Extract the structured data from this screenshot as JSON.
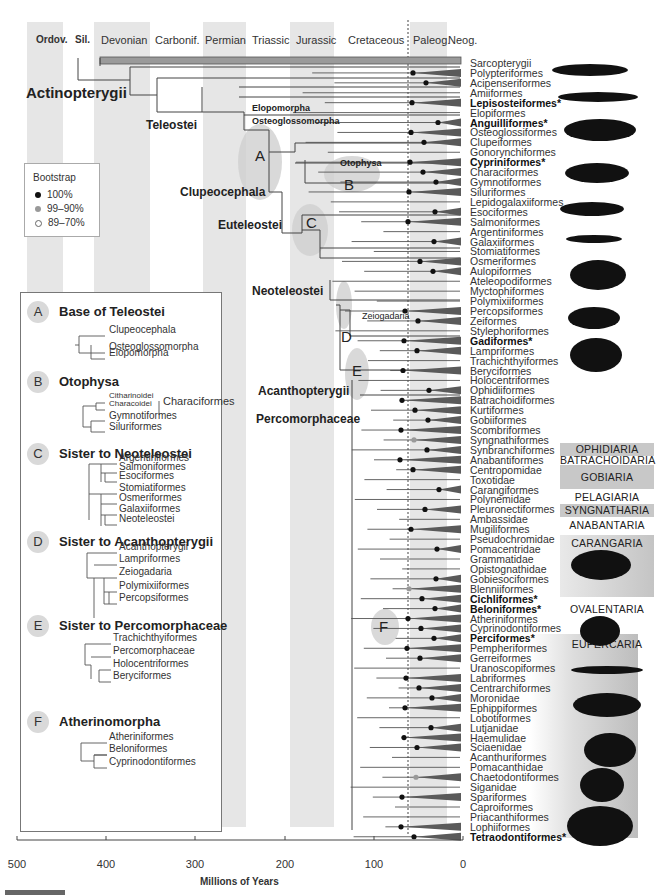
{
  "figure": {
    "axis_title": "Millions of Years",
    "axis_ticks": [
      "500",
      "400",
      "300",
      "200",
      "100",
      "0"
    ],
    "kpg_boundary_ma": 66
  },
  "periods": [
    {
      "label": "Ordov.",
      "bold": true
    },
    {
      "label": "Sil.",
      "bold": true
    },
    {
      "label": "Devonian"
    },
    {
      "label": "Carbonif."
    },
    {
      "label": "Permian"
    },
    {
      "label": "Triassic"
    },
    {
      "label": "Jurassic"
    },
    {
      "label": "Cretaceous"
    },
    {
      "label": "Paleog."
    },
    {
      "label": "Neog."
    }
  ],
  "bootstrap": {
    "title": "Bootstrap",
    "items": [
      {
        "label": "100%",
        "color": "#111111"
      },
      {
        "label": "99–90%",
        "color": "#999999"
      },
      {
        "label": "89–70%",
        "color": "#ffffff"
      }
    ]
  },
  "clades": {
    "actinopterygii": "Actinopterygii",
    "teleostei": "Teleostei",
    "elopomorpha": "Elopomorpha",
    "osteoglossomorpha": "Osteoglossomorpha",
    "clupeocephala": "Clupeocephala",
    "otophysa": "Otophysa",
    "euteleostei": "Euteleostei",
    "neoteleostei": "Neoteleostei",
    "zeiogadaria": "Zeiogadaria",
    "acanthopterygii": "Acanthopterygii",
    "percomorphaceae": "Percomorphaceae",
    "markers": [
      "A",
      "B",
      "C",
      "D",
      "E",
      "F"
    ]
  },
  "taxa": [
    {
      "name": "Sarcopterygii"
    },
    {
      "name": "Polypteriformes"
    },
    {
      "name": "Acipenseriformes"
    },
    {
      "name": "Amiiformes"
    },
    {
      "name": "Lepisosteiformes*",
      "bold": true
    },
    {
      "name": "Elopiformes"
    },
    {
      "name": "Anguilliformes*",
      "bold": true
    },
    {
      "name": "Osteoglossiformes"
    },
    {
      "name": "Clupeiformes"
    },
    {
      "name": "Gonorynchiformes"
    },
    {
      "name": "Cypriniformes*",
      "bold": true
    },
    {
      "name": "Characiformes"
    },
    {
      "name": "Gymnotiformes"
    },
    {
      "name": "Siluriformes"
    },
    {
      "name": "Lepidogalaxiiformes"
    },
    {
      "name": "Esociformes"
    },
    {
      "name": "Salmoniformes"
    },
    {
      "name": "Argentiniformes"
    },
    {
      "name": "Galaxiiformes"
    },
    {
      "name": "Stomiatiformes"
    },
    {
      "name": "Osmeriformes"
    },
    {
      "name": "Aulopiformes"
    },
    {
      "name": "Ateleopodiformes"
    },
    {
      "name": "Myctophiformes"
    },
    {
      "name": "Polymixiiformes"
    },
    {
      "name": "Percopsiformes"
    },
    {
      "name": "Zeiformes"
    },
    {
      "name": "Stylephoriformes"
    },
    {
      "name": "Gadiformes*",
      "bold": true
    },
    {
      "name": "Lampriformes"
    },
    {
      "name": "Trachichthyiformes"
    },
    {
      "name": "Beryciformes"
    },
    {
      "name": "Holocentriformes"
    },
    {
      "name": "Ophidiiformes"
    },
    {
      "name": "Batrachoidiformes"
    },
    {
      "name": "Kurtiformes"
    },
    {
      "name": "Gobiiformes"
    },
    {
      "name": "Scombriformes"
    },
    {
      "name": "Syngnathiformes"
    },
    {
      "name": "Synbranchiformes"
    },
    {
      "name": "Anabantiformes"
    },
    {
      "name": "Centropomidae"
    },
    {
      "name": "Toxotidae"
    },
    {
      "name": "Carangiformes"
    },
    {
      "name": "Polynemidae"
    },
    {
      "name": "Pleuronectiformes"
    },
    {
      "name": "Ambassidae"
    },
    {
      "name": "Mugiliformes"
    },
    {
      "name": "Pseudochromidae"
    },
    {
      "name": "Pomacentridae"
    },
    {
      "name": "Grammatidae"
    },
    {
      "name": "Opistognathidae"
    },
    {
      "name": "Gobiesociformes"
    },
    {
      "name": "Blenniiformes"
    },
    {
      "name": "Cichliformes*",
      "bold": true
    },
    {
      "name": "Beloniformes*",
      "bold": true
    },
    {
      "name": "Atheriniformes"
    },
    {
      "name": "Cyprinodontiformes"
    },
    {
      "name": "Perciformes*",
      "bold": true
    },
    {
      "name": "Pempheriformes"
    },
    {
      "name": "Gerreiformes"
    },
    {
      "name": "Uranoscopiformes"
    },
    {
      "name": "Labriformes"
    },
    {
      "name": "Centrarchiformes"
    },
    {
      "name": "Moronidae"
    },
    {
      "name": "Ephippiformes"
    },
    {
      "name": "Lobotiformes"
    },
    {
      "name": "Lutjanidae"
    },
    {
      "name": "Haemulidae"
    },
    {
      "name": "Sciaenidae"
    },
    {
      "name": "Acanthuriformes"
    },
    {
      "name": "Pomacanthidae"
    },
    {
      "name": "Chaetodontiformes"
    },
    {
      "name": "Siganidae"
    },
    {
      "name": "Spariformes"
    },
    {
      "name": "Caproiformes"
    },
    {
      "name": "Priacanthiformes"
    },
    {
      "name": "Lophiiformes"
    },
    {
      "name": "Tetraodontiformes*",
      "bold": true
    }
  ],
  "series_tags": [
    {
      "label": "OPHIDIARIA",
      "shaded": true
    },
    {
      "label": "BATRACHOIDARIA",
      "shaded": false
    },
    {
      "label": "GOBIARIA",
      "shaded": true
    },
    {
      "label": "PELAGIARIA",
      "shaded": false
    },
    {
      "label": "SYNGNATHARIA",
      "shaded": true
    },
    {
      "label": "ANABANTARIA",
      "shaded": false
    },
    {
      "label": "CARANGARIA",
      "shaded": true
    },
    {
      "label": "OVALENTARIA",
      "shaded": false
    },
    {
      "label": "EUPERCARIA",
      "shaded": true
    }
  ],
  "legend": {
    "sections": [
      {
        "key": "A",
        "title": "Base of Teleostei",
        "items": [
          "Clupeocephala",
          "Osteoglossomorpha",
          "Elopomorpha"
        ]
      },
      {
        "key": "B",
        "title": "Otophysa",
        "items": [
          "Citharinoidei",
          "Characoidei",
          "Gymnotiformes",
          "Siluriformes"
        ],
        "group_label": "Characiformes"
      },
      {
        "key": "C",
        "title": "Sister to Neoteleostei",
        "items": [
          "Argentiniformes",
          "Salmoniformes",
          "Esociformes",
          "Stomiatiformes",
          "Osmeriformes",
          "Galaxiiformes",
          "Neoteleostei"
        ]
      },
      {
        "key": "D",
        "title": "Sister to Acanthopterygii",
        "items": [
          "Acanthopterygii",
          "Lampriformes",
          "Zeiogadaria",
          "Polymixiiformes",
          "Percopsiformes"
        ]
      },
      {
        "key": "E",
        "title": "Sister to Percomorphaceae",
        "items": [
          "Trachichthyiformes",
          "Percomorphaceae",
          "Holocentriformes",
          "Beryciformes"
        ]
      },
      {
        "key": "F",
        "title": "Atherinomorpha",
        "items": [
          "Atheriniformes",
          "Beloniformes",
          "Cyprinodontiformes"
        ]
      }
    ]
  }
}
